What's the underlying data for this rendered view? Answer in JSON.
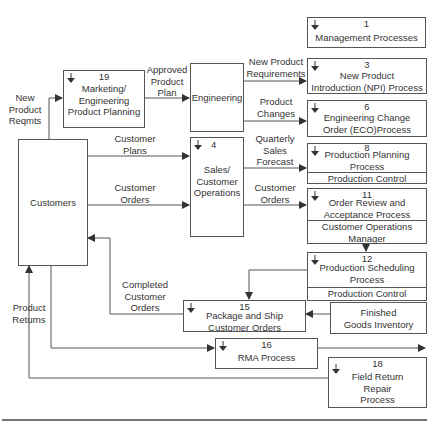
{
  "diagram": {
    "boxes": {
      "management": {
        "num": "1",
        "title": "Management Processes"
      },
      "mkt_eng": {
        "num": "19",
        "title_lines": [
          "Marketing/",
          "Engineering",
          "Product Planning"
        ]
      },
      "engineering": {
        "title": "Engineering"
      },
      "npi": {
        "num": "3",
        "title_lines": [
          "New Product",
          "Introduction (NPI) Process"
        ]
      },
      "eco": {
        "num": "6",
        "title_lines": [
          "Engineering Change",
          "Order (ECO)Process"
        ]
      },
      "customers": {
        "title": "Customers"
      },
      "sales_ops": {
        "num": "4",
        "title_lines": [
          "Sales/",
          "Customer",
          "Operations"
        ]
      },
      "prod_planning": {
        "num": "8",
        "title_lines": [
          "Production Planning",
          "Process"
        ],
        "role": "Production Control Manager"
      },
      "order_review": {
        "num": "11",
        "title_lines": [
          "Order Review and",
          "Acceptance Process"
        ],
        "role_lines": [
          "Customer Operations",
          "Manager"
        ]
      },
      "prod_scheduling": {
        "num": "12",
        "title_lines": [
          "Production Scheduling",
          "Process"
        ],
        "role": "Production Control Manager"
      },
      "package_ship": {
        "num": "15",
        "title_lines": [
          "Package and Ship",
          "Customer Orders"
        ]
      },
      "finished_goods": {
        "title_lines": [
          "Finished",
          "Goods Inventory"
        ]
      },
      "rma": {
        "num": "16",
        "title": "RMA Process"
      },
      "field_return": {
        "num": "18",
        "title_lines": [
          "Field Return",
          "Repair",
          "Process"
        ]
      }
    },
    "flow_labels": {
      "new_product_reqmts": [
        "New",
        "Product",
        "Reqmts"
      ],
      "approved_product_plan": [
        "Approved",
        "Product",
        "Plan"
      ],
      "new_product_requirements": [
        "New Product",
        "Requirements"
      ],
      "product_changes": [
        "Product",
        "Changes"
      ],
      "customer_plans": [
        "Customer",
        "Plans"
      ],
      "customer_orders_in": [
        "Customer",
        "Orders"
      ],
      "quarterly_sales_forecast": [
        "Quarterly",
        "Sales",
        "Forecast"
      ],
      "customer_orders_out": [
        "Customer",
        "Orders"
      ],
      "completed_customer_orders": [
        "Completed",
        "Customer",
        "Orders"
      ],
      "product_returns": [
        "Product",
        "Returns"
      ]
    },
    "colors": {
      "line": "#555555",
      "text": "#333333",
      "background": "#ffffff"
    }
  }
}
